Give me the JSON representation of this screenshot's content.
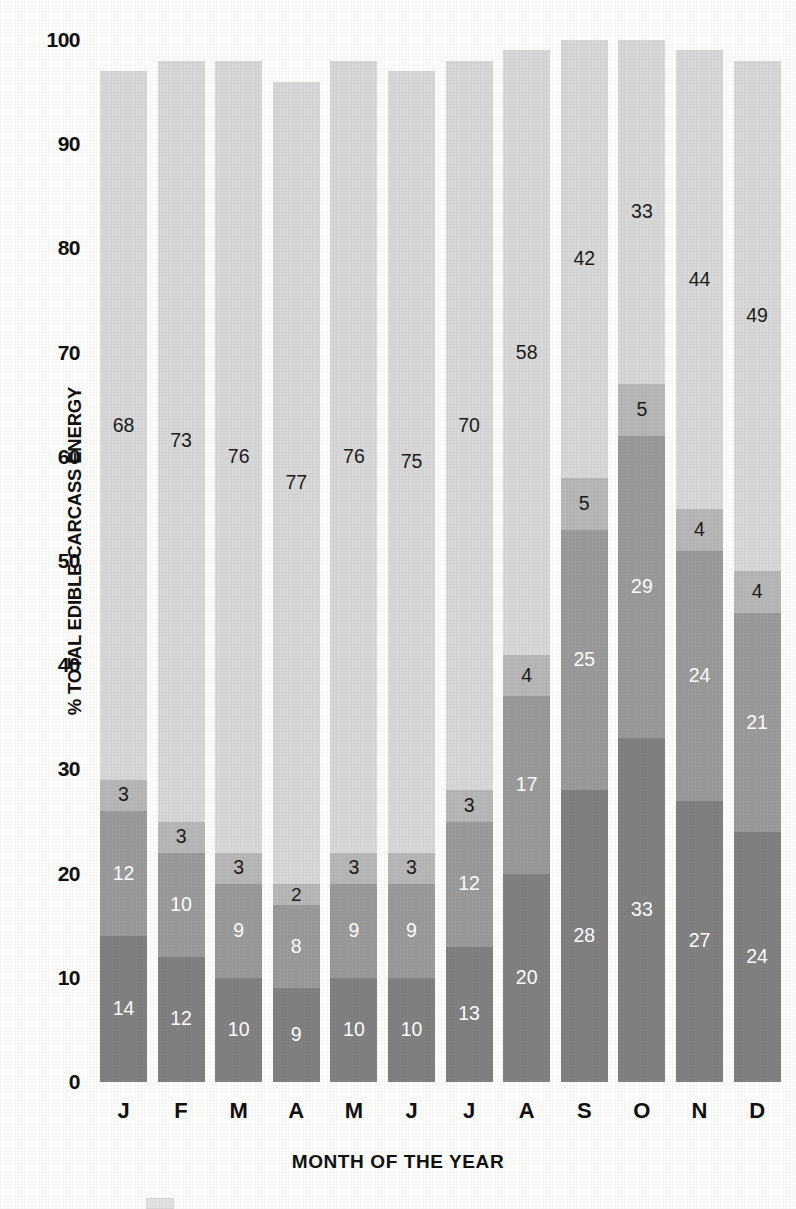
{
  "chart_data": {
    "type": "bar",
    "subtype": "stacked-bar",
    "title": "",
    "xlabel": "MONTH OF THE YEAR",
    "ylabel": "% TOTAL EDIBLE CARCASS ENERGY",
    "ylim": [
      0,
      100
    ],
    "yticks": [
      0,
      10,
      20,
      30,
      40,
      50,
      60,
      70,
      80,
      90,
      100
    ],
    "ytick_labels": [
      "0",
      "10",
      "20",
      "30",
      "40",
      "50",
      "60",
      "70",
      "80",
      "90",
      "100"
    ],
    "grid": false,
    "legend_position": "bottom",
    "categories": [
      "J",
      "F",
      "M",
      "A",
      "M",
      "J",
      "J",
      "A",
      "S",
      "O",
      "N",
      "D"
    ],
    "category_names": [
      "January",
      "February",
      "March",
      "April",
      "May",
      "June",
      "July",
      "August",
      "September",
      "October",
      "November",
      "December"
    ],
    "series": [
      {
        "name": "segment-1",
        "stack_order": 1,
        "color": "#818181",
        "label_color": "#ffffff",
        "values": [
          14,
          12,
          10,
          9,
          10,
          10,
          13,
          20,
          28,
          33,
          27,
          24
        ]
      },
      {
        "name": "segment-2",
        "stack_order": 2,
        "color": "#9b9b9b",
        "label_color": "#ffffff",
        "values": [
          12,
          10,
          9,
          8,
          9,
          9,
          12,
          17,
          25,
          29,
          24,
          21
        ]
      },
      {
        "name": "segment-3",
        "stack_order": 3,
        "color": "#b7b7b7",
        "label_color": "#1c1c1c",
        "values": [
          3,
          3,
          3,
          2,
          3,
          3,
          3,
          4,
          5,
          5,
          4,
          4
        ]
      },
      {
        "name": "segment-4",
        "stack_order": 4,
        "color": "#d8d8d8",
        "label_color": "#1c1c1c",
        "values": [
          68,
          73,
          76,
          77,
          76,
          75,
          70,
          58,
          42,
          33,
          44,
          49
        ]
      }
    ],
    "totals": [
      97,
      98,
      98,
      96,
      98,
      97,
      98,
      99,
      100,
      100,
      99,
      98
    ]
  },
  "axes": {
    "y_title": "% TOTAL EDIBLE CARCASS ENERGY",
    "x_title": "MONTH OF THE YEAR"
  },
  "legend": {
    "visible_swatch_color": "#e3e3e3",
    "label": ""
  },
  "colors": {
    "background": "#fcfcfa",
    "text": "#111111",
    "segment_1": "#818181",
    "segment_2": "#9b9b9b",
    "segment_3": "#b7b7b7",
    "segment_4": "#d8d8d8"
  }
}
